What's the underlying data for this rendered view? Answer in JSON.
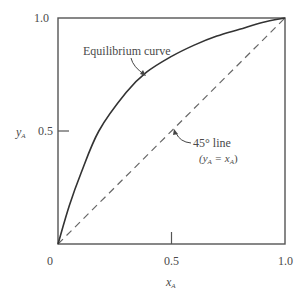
{
  "chart_data": {
    "type": "line",
    "title": "",
    "xlabel": "x_A",
    "ylabel": "y_A",
    "xlim": [
      0,
      1.0
    ],
    "ylim": [
      0,
      1.0
    ],
    "grid": false,
    "x_ticks": [
      "0",
      "0.5",
      "1.0"
    ],
    "y_ticks": [
      "0.5",
      "1.0"
    ],
    "series": [
      {
        "name": "Equilibrium curve",
        "style": "solid",
        "x": [
          0,
          0.05,
          0.1,
          0.18,
          0.3,
          0.39,
          0.5,
          0.6,
          0.7,
          0.8,
          0.9,
          1.0
        ],
        "y": [
          0,
          0.17,
          0.31,
          0.5,
          0.67,
          0.76,
          0.83,
          0.88,
          0.92,
          0.95,
          0.98,
          1.0
        ]
      },
      {
        "name": "45° line (y_A = x_A)",
        "style": "dashed",
        "x": [
          0,
          1.0
        ],
        "y": [
          0,
          1.0
        ]
      }
    ],
    "annotations": [
      {
        "text": "Equilibrium curve",
        "points_to": [
          0.39,
          0.76
        ]
      },
      {
        "text": "45° line",
        "subtext": "(y_A = x_A)",
        "points_to": [
          0.5,
          0.5
        ]
      }
    ]
  },
  "labels": {
    "y_tick_top": "1.0",
    "y_tick_mid": "0.5",
    "x_tick_left": "0",
    "x_tick_mid": "0.5",
    "x_tick_right": "1.0",
    "y_axis_var": "y",
    "y_axis_sub": "A",
    "x_axis_var": "x",
    "x_axis_sub": "A",
    "equilibrium_label": "Equilibrium curve",
    "line45_label": "45° line",
    "line45_eq_open": "(y",
    "line45_eq_sub1": "A",
    "line45_eq_mid": " = x",
    "line45_eq_sub2": "A",
    "line45_eq_close": ")"
  }
}
